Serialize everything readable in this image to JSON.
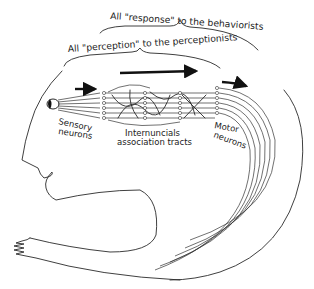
{
  "figure": {
    "brackets": {
      "outer": "All \"response\" to the behaviorists",
      "inner": "All \"perception\" to the perceptionists"
    },
    "labels": {
      "sensory": [
        "Sensory",
        "neurons"
      ],
      "internuncial": [
        "Internuncials",
        "association tracts"
      ],
      "motor": [
        "Motor",
        "neurons"
      ]
    },
    "colors": {
      "ink": "#222222",
      "background": "#ffffff"
    }
  }
}
